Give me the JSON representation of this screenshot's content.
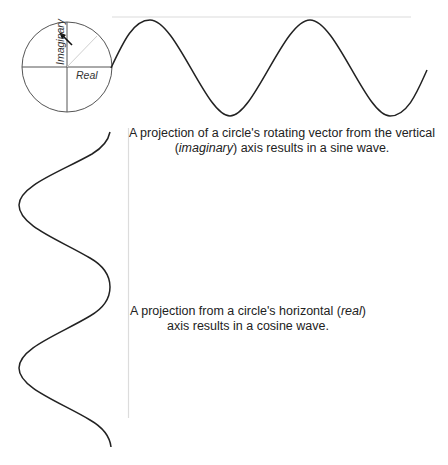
{
  "diagram": {
    "circle": {
      "axis_labels": {
        "vertical": "Imaginary",
        "horizontal": "Real"
      },
      "center": [
        67,
        67
      ],
      "radius": 45
    },
    "sine_caption": {
      "part1": "A projection of a circle's rotating vector from the vertical (",
      "emph": "imaginary",
      "part2": ") axis results in a sine wave."
    },
    "cosine_caption": {
      "part1": "A projection from a circle's horizontal (",
      "emph": "real",
      "part2": ") axis results in a cosine wave."
    },
    "colors": {
      "stroke": "#222222",
      "guide": "#d8d8d8",
      "text": "#222222"
    }
  }
}
